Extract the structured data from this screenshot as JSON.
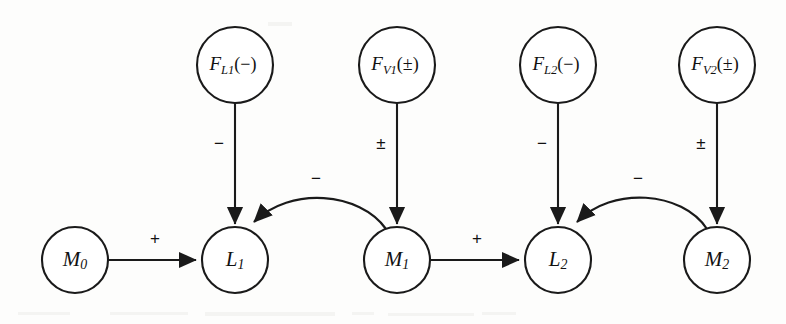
{
  "diagram": {
    "type": "influence-diagram",
    "title": "",
    "background_color": "#fdfdfc",
    "stroke_color": "#1a1a1a",
    "nodes": [
      {
        "id": "M0",
        "label_base": "M",
        "label_sub": "0",
        "label_suffix": "",
        "full_label": "M0",
        "row": "bottom",
        "cx": 75,
        "cy": 260,
        "r": 33
      },
      {
        "id": "L1",
        "label_base": "L",
        "label_sub": "1",
        "label_suffix": "",
        "full_label": "L1",
        "row": "bottom",
        "cx": 235,
        "cy": 260,
        "r": 33
      },
      {
        "id": "M1",
        "label_base": "M",
        "label_sub": "1",
        "label_suffix": "",
        "full_label": "M1",
        "row": "bottom",
        "cx": 397,
        "cy": 260,
        "r": 33
      },
      {
        "id": "L2",
        "label_base": "L",
        "label_sub": "2",
        "label_suffix": "",
        "full_label": "L2",
        "row": "bottom",
        "cx": 558,
        "cy": 260,
        "r": 33
      },
      {
        "id": "M2",
        "label_base": "M",
        "label_sub": "2",
        "label_suffix": "",
        "full_label": "M2",
        "row": "bottom",
        "cx": 717,
        "cy": 260,
        "r": 33
      },
      {
        "id": "FL1",
        "label_base": "F",
        "label_sub": "L1",
        "label_suffix": "(−)",
        "full_label": "FL1(−)",
        "row": "top",
        "cx": 235,
        "cy": 65,
        "r": 38
      },
      {
        "id": "FV1",
        "label_base": "F",
        "label_sub": "V1",
        "label_suffix": "(±)",
        "full_label": "FV1(±)",
        "row": "top",
        "cx": 397,
        "cy": 65,
        "r": 38
      },
      {
        "id": "FL2",
        "label_base": "F",
        "label_sub": "L2",
        "label_suffix": "(−)",
        "full_label": "FL2(−)",
        "row": "top",
        "cx": 558,
        "cy": 65,
        "r": 38
      },
      {
        "id": "FV2",
        "label_base": "F",
        "label_sub": "V2",
        "label_suffix": "(±)",
        "full_label": "FV2(±)",
        "row": "top",
        "cx": 717,
        "cy": 65,
        "r": 38
      }
    ],
    "edges": [
      {
        "id": "e-m0-l1",
        "from": "M0",
        "to": "L1",
        "sign": "+",
        "kind": "straight-horizontal",
        "label_x": 155,
        "label_y": 240
      },
      {
        "id": "e-m1-l2",
        "from": "M1",
        "to": "L2",
        "sign": "+",
        "kind": "straight-horizontal",
        "label_x": 477,
        "label_y": 240
      },
      {
        "id": "e-fl1-l1",
        "from": "FL1",
        "to": "L1",
        "sign": "−",
        "kind": "straight-vertical",
        "label_x": 219,
        "label_y": 145
      },
      {
        "id": "e-fv1-m1",
        "from": "FV1",
        "to": "M1",
        "sign": "±",
        "kind": "straight-vertical",
        "label_x": 381,
        "label_y": 145
      },
      {
        "id": "e-fl2-l2",
        "from": "FL2",
        "to": "L2",
        "sign": "−",
        "kind": "straight-vertical",
        "label_x": 542,
        "label_y": 145
      },
      {
        "id": "e-fv2-m2",
        "from": "FV2",
        "to": "M2",
        "sign": "±",
        "kind": "straight-vertical",
        "label_x": 701,
        "label_y": 145
      },
      {
        "id": "e-m1-l1",
        "from": "M1",
        "to": "L1",
        "sign": "−",
        "kind": "curved-arc",
        "label_x": 316,
        "label_y": 180
      },
      {
        "id": "e-m2-l2",
        "from": "M2",
        "to": "L2",
        "sign": "−",
        "kind": "curved-arc",
        "label_x": 638,
        "label_y": 180
      }
    ]
  }
}
